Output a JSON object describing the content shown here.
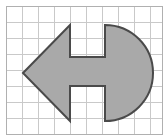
{
  "figure": {
    "title": "Shaded composite shape on graph paper",
    "canvas": {
      "width": 168,
      "height": 140
    },
    "colors": {
      "background": "#ffffff",
      "grid_line": "#c9c9c9",
      "grid_border": "#b0b0b0",
      "shape_fill": "#a9a9a9",
      "shape_stroke": "#4a4a4a"
    },
    "grid": {
      "cell_size": 16,
      "columns": 9,
      "rows": 8,
      "origin_x": 6,
      "origin_y": 6,
      "line_width": 1,
      "visible": true
    },
    "shape": {
      "name": "arrow-circle-h-cutout",
      "fill": "#a9a9a9",
      "stroke": "#4a4a4a",
      "stroke_width": 2,
      "tip_point": [
        23,
        73
      ],
      "triangle_top_vertex": [
        70,
        25
      ],
      "triangle_bottom_vertex": [
        70,
        121
      ],
      "circle_center_x": 105,
      "circle_radius": 48,
      "notch_left_x": 70,
      "notch_right_x": 105,
      "notch_top_height": 32,
      "notch_bottom_height": 35,
      "path": "M 23 73 L 70 25 L 70 57 L 105 57 L 105 25 A 48 48 0 0 1 105 121 L 105 86 L 70 86 L 70 121 Z"
    }
  }
}
